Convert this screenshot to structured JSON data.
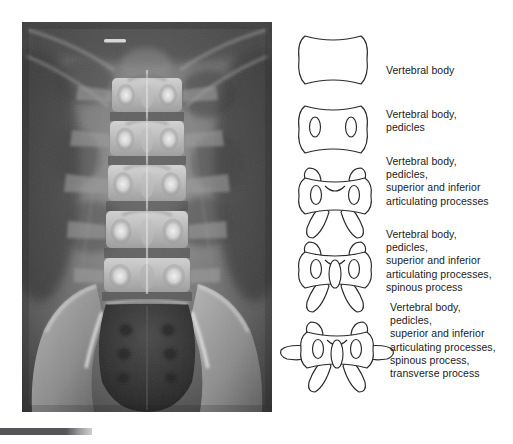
{
  "figure": {
    "type": "anatomy-diagram-with-radiograph",
    "radiograph": {
      "name": "ap-lumbar-spine-radiograph",
      "view": "anteroposterior",
      "region": "lumbar spine and pelvis",
      "modality": "x-ray",
      "description": "Grayscale AP radiograph of the lumbar spine showing vertebral bodies, pedicles, spinous processes, transverse processes, sacrum and iliac wings"
    },
    "caption_bar": {
      "name": "caption-rule"
    },
    "diagrams": [
      {
        "id": "vertebra-1",
        "structures": "vertebral-body",
        "label": "Vertebral body"
      },
      {
        "id": "vertebra-2",
        "structures": "vertebral-body-pedicles",
        "label": "Vertebral body,\npedicles"
      },
      {
        "id": "vertebra-3",
        "structures": "vertebral-body-pedicles-articulating-processes",
        "label": "Vertebral body,\npedicles,\nsuperior and inferior\narticulating processes"
      },
      {
        "id": "vertebra-4",
        "structures": "vertebral-body-pedicles-articulating-processes-spinous-process",
        "label": "Vertebral body,\npedicles,\nsuperior and inferior\narticulating processes,\nspinous process"
      },
      {
        "id": "vertebra-5",
        "structures": "vertebral-body-pedicles-articulating-processes-spinous-process-transverse-process",
        "label": "Vertebral body,\npedicles,\nsuperior and inferior\narticulating processes,\nspinous process,\ntransverse process"
      }
    ],
    "colors": {
      "line_art": "#2a2a2a",
      "text": "#1b1b1b",
      "background": "#ffffff",
      "caption_bar": "#55565a"
    }
  }
}
